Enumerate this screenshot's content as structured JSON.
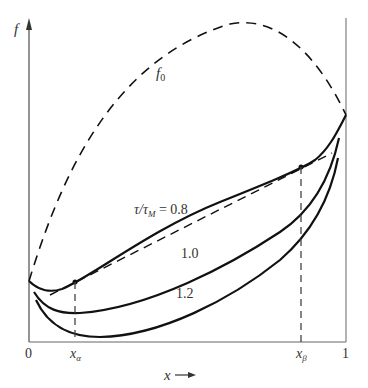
{
  "diagram": {
    "y_axis_label": "f",
    "x_axis_label": "x",
    "x_ticks": {
      "zero": "0",
      "one": "1",
      "x_alpha_base": "x",
      "x_alpha_sub": "α",
      "x_beta_base": "x",
      "x_beta_sub": "β"
    },
    "f0_label_base": "f",
    "f0_label_sub": "0",
    "curve_labels": {
      "c08_prefix": "τ/τ",
      "c08_sub": "M",
      "c08_value": " = 0.8",
      "c10": "1.0",
      "c12": "1.2"
    },
    "colors": {
      "curve": "#111111",
      "axis": "#555555",
      "text": "#333333"
    }
  }
}
